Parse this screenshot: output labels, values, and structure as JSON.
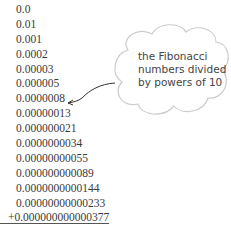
{
  "numbers": [
    "0.0",
    "0.01",
    "0.001",
    "0.0002",
    "0.00003",
    "0.000005",
    "0.0000008",
    "0.00000013",
    "0.000000021",
    "0.0000000034",
    "0.00000000055",
    "0.000000000089",
    "0.0000000000144",
    "0.00000000000233",
    "+0.000000000000377"
  ],
  "annotation": {
    "lines": [
      "the Fibonacci",
      "numbers divided",
      "by powers of 10"
    ],
    "points_to_index": 6
  },
  "colors": {
    "text": "#3a3a3a",
    "cloud_stroke": "#cccccc",
    "annotation_text": "#444444"
  }
}
